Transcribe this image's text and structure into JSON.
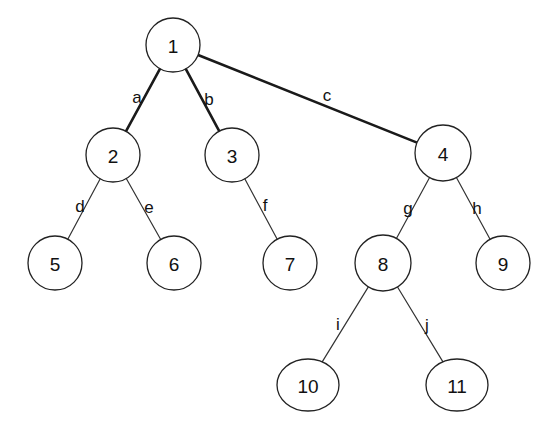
{
  "diagram": {
    "type": "tree",
    "nodes": [
      {
        "id": "1",
        "label": "1",
        "x": 173,
        "y": 45,
        "rx": 27,
        "ry": 27
      },
      {
        "id": "2",
        "label": "2",
        "x": 113,
        "y": 155,
        "rx": 27,
        "ry": 27
      },
      {
        "id": "3",
        "label": "3",
        "x": 232,
        "y": 155,
        "rx": 27,
        "ry": 27
      },
      {
        "id": "4",
        "label": "4",
        "x": 443,
        "y": 153,
        "rx": 28,
        "ry": 28
      },
      {
        "id": "5",
        "label": "5",
        "x": 55,
        "y": 263,
        "rx": 27,
        "ry": 27
      },
      {
        "id": "6",
        "label": "6",
        "x": 174,
        "y": 263,
        "rx": 27,
        "ry": 27
      },
      {
        "id": "7",
        "label": "7",
        "x": 290,
        "y": 263,
        "rx": 27,
        "ry": 27
      },
      {
        "id": "8",
        "label": "8",
        "x": 383,
        "y": 263,
        "rx": 28,
        "ry": 28
      },
      {
        "id": "9",
        "label": "9",
        "x": 503,
        "y": 263,
        "rx": 27,
        "ry": 27
      },
      {
        "id": "10",
        "label": "10",
        "x": 308,
        "y": 385,
        "rx": 31,
        "ry": 26
      },
      {
        "id": "11",
        "label": "11",
        "x": 457,
        "y": 385,
        "rx": 31,
        "ry": 26
      }
    ],
    "edges": [
      {
        "id": "a",
        "label": "a",
        "from": "1",
        "to": "2",
        "weight": "thick",
        "lx": 137,
        "ly": 97
      },
      {
        "id": "b",
        "label": "b",
        "from": "1",
        "to": "3",
        "weight": "thick",
        "lx": 209,
        "ly": 99
      },
      {
        "id": "c",
        "label": "c",
        "from": "1",
        "to": "4",
        "weight": "thick",
        "lx": 327,
        "ly": 95
      },
      {
        "id": "d",
        "label": "d",
        "from": "2",
        "to": "5",
        "weight": "thin",
        "lx": 80,
        "ly": 206
      },
      {
        "id": "e",
        "label": "e",
        "from": "2",
        "to": "6",
        "weight": "thin",
        "lx": 149,
        "ly": 207
      },
      {
        "id": "f",
        "label": "f",
        "from": "3",
        "to": "7",
        "weight": "thin",
        "lx": 265,
        "ly": 205
      },
      {
        "id": "g",
        "label": "g",
        "from": "4",
        "to": "8",
        "weight": "thin",
        "lx": 408,
        "ly": 208
      },
      {
        "id": "h",
        "label": "h",
        "from": "4",
        "to": "9",
        "weight": "thin",
        "lx": 477,
        "ly": 208
      },
      {
        "id": "i",
        "label": "i",
        "from": "8",
        "to": "10",
        "weight": "thin",
        "lx": 338,
        "ly": 324
      },
      {
        "id": "j",
        "label": "j",
        "from": "8",
        "to": "11",
        "weight": "thin",
        "lx": 427,
        "ly": 325
      }
    ]
  }
}
